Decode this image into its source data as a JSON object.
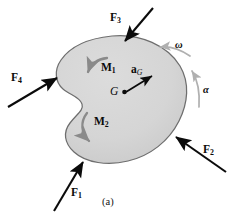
{
  "figure": {
    "caption": "(a)",
    "body": {
      "name": "rigid-body",
      "fill_color": "#d6d6d6",
      "stroke_color": "#6e6e6e"
    },
    "forces": [
      {
        "id": "F1",
        "letter": "F",
        "subscript": "1",
        "label": "F₁",
        "direction": "up-right",
        "description": "force applied at lower-left boundary"
      },
      {
        "id": "F2",
        "letter": "F",
        "subscript": "2",
        "label": "F₂",
        "direction": "up-left",
        "description": "force applied at lower-right boundary"
      },
      {
        "id": "F3",
        "letter": "F",
        "subscript": "3",
        "label": "F₃",
        "direction": "down-left",
        "description": "force applied at top boundary"
      },
      {
        "id": "F4",
        "letter": "F",
        "subscript": "4",
        "label": "F₄",
        "direction": "up-right",
        "description": "force applied at left boundary"
      }
    ],
    "moments": [
      {
        "id": "M1",
        "letter": "M",
        "subscript": "1",
        "label": "M₁",
        "sense": "counterclockwise"
      },
      {
        "id": "M2",
        "letter": "M",
        "subscript": "2",
        "label": "M₂",
        "sense": "clockwise"
      }
    ],
    "mass_center": {
      "id": "G",
      "label": "G"
    },
    "acceleration": {
      "id": "aG",
      "letter": "a",
      "subscript": "G",
      "label": "aᴳ",
      "direction": "up-right"
    },
    "angular_velocity": {
      "id": "omega",
      "label": "ω",
      "sense": "counterclockwise"
    },
    "angular_acceleration": {
      "id": "alpha",
      "label": "α",
      "sense": "counterclockwise"
    },
    "colors": {
      "body_fill": "#d6d6d6",
      "body_stroke": "#6e6e6e",
      "arrow_black": "#0b0b0b",
      "arrow_gray": "#8a8a8a",
      "arrow_light_gray": "#b0b0b0"
    }
  }
}
